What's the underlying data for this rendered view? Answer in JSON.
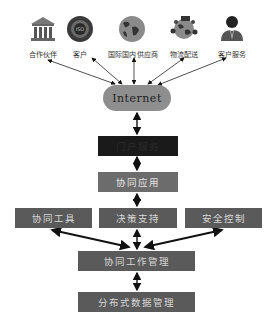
{
  "diagram": {
    "external_nodes": [
      {
        "label": "合作伙伴",
        "icon": "bank-building-icon"
      },
      {
        "label": "客户",
        "icon": "iso-badge-icon"
      },
      {
        "label": "国际国内供应商",
        "icon": "globe-icon"
      },
      {
        "label": "物流配送",
        "icon": "globe-logistics-icon"
      },
      {
        "label": "客户服务",
        "icon": "service-person-icon"
      }
    ],
    "internet": {
      "label": "Internet"
    },
    "layers": {
      "portal": {
        "label": "门户服务"
      },
      "app": {
        "label": "协同应用"
      },
      "tools": {
        "label": "协同工具"
      },
      "decision": {
        "label": "决策支持"
      },
      "security": {
        "label": "安全控制"
      },
      "work_mgmt": {
        "label": "协同工作管理"
      },
      "data_mgmt": {
        "label": "分布式数据管理"
      }
    },
    "colors": {
      "dark_box": "#1a1a1a",
      "gray_box": "#5a5a5a",
      "internet_pill": "#8e8e8e",
      "arrow": "#111111"
    }
  }
}
